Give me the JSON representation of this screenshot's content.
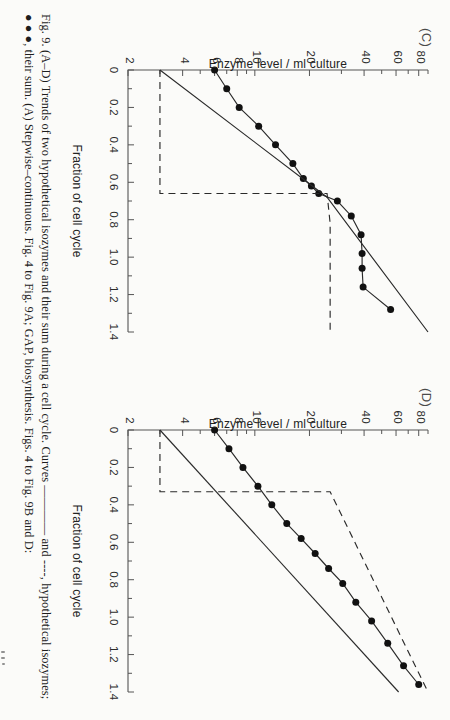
{
  "figure": {
    "caption_label": "Fig. 9.",
    "caption_line1": "Fig. 9. (A–D) Trends of two hypothetical isozymes and their sum during a cell cycle. Curves ———— and ----, hypothetical isozymes;",
    "caption_line2": "● ● ●, their sum. (A) Stepwise–continuous. Fig. 4 to Fig. 9A; GAP, biosynthesis. Figs. 4 to Fig. 9B and D:"
  },
  "chart_data": [
    {
      "type": "line",
      "panel": "(C)",
      "title": "(C)",
      "xlabel": "Fraction of cell cycle",
      "ylabel": "Enzyme level / ml culture",
      "xlim": [
        0,
        1.4
      ],
      "ylim": [
        2,
        90
      ],
      "yscale": "log",
      "xticks": [
        0,
        0.2,
        0.4,
        0.6,
        0.8,
        1.0,
        1.2,
        1.4
      ],
      "xticklabels": [
        "0",
        "0.2",
        "0.4",
        "0.6",
        "0.8",
        "1.0",
        "1.2",
        "1.4"
      ],
      "yticks": [
        2,
        4,
        6,
        8,
        10,
        20,
        40,
        60,
        80
      ],
      "yticklabels": [
        "2",
        "4",
        "6",
        "8",
        "10",
        "20",
        "40",
        "60",
        "80"
      ],
      "grid": false,
      "legend": false,
      "series": [
        {
          "name": "sum",
          "style": "markers-line",
          "marker": "filled-circle",
          "x": [
            0.0,
            0.1,
            0.2,
            0.3,
            0.4,
            0.5,
            0.58,
            0.62,
            0.66,
            0.7,
            0.78,
            0.88,
            0.98,
            1.06,
            1.16,
            1.28
          ],
          "y": [
            6.0,
            7.0,
            8.2,
            10.5,
            13.0,
            16.2,
            18.5,
            20.5,
            22.5,
            28.5,
            34.0,
            38.5,
            39.0,
            39.0,
            39.5,
            56.0
          ]
        },
        {
          "name": "isozyme-continuous",
          "style": "solid",
          "x": [
            0.0,
            0.68,
            1.4
          ],
          "y": [
            3.0,
            25.0,
            90.0
          ]
        },
        {
          "name": "isozyme-stepwise",
          "style": "dashed",
          "x": [
            0.0,
            0.66,
            0.66,
            0.82,
            1.4
          ],
          "y": [
            3.0,
            3.0,
            25.0,
            26.0,
            26.0
          ]
        }
      ]
    },
    {
      "type": "line",
      "panel": "(D)",
      "title": "(D)",
      "xlabel": "Fraction of cell cycle",
      "ylabel": "Enzyme level / ml culture",
      "xlim": [
        0,
        1.4
      ],
      "ylim": [
        2,
        90
      ],
      "yscale": "log",
      "xticks": [
        0,
        0.2,
        0.4,
        0.6,
        0.8,
        1.0,
        1.2,
        1.4
      ],
      "xticklabels": [
        "0",
        "0.2",
        "0.4",
        "0.6",
        "0.8",
        "1.0",
        "1.2",
        "1.4"
      ],
      "yticks": [
        2,
        4,
        6,
        8,
        10,
        20,
        40,
        60,
        80
      ],
      "yticklabels": [
        "2",
        "4",
        "6",
        "8",
        "10",
        "20",
        "40",
        "60",
        "80"
      ],
      "grid": false,
      "legend": false,
      "series": [
        {
          "name": "sum",
          "style": "markers-line",
          "marker": "filled-circle",
          "x": [
            0.0,
            0.1,
            0.2,
            0.3,
            0.4,
            0.5,
            0.58,
            0.66,
            0.74,
            0.82,
            0.92,
            1.02,
            1.14,
            1.26,
            1.36
          ],
          "y": [
            6.0,
            7.2,
            8.6,
            10.4,
            12.4,
            15.0,
            18.0,
            21.5,
            25.5,
            30.5,
            36.0,
            44.0,
            54.0,
            66.0,
            80.0
          ]
        },
        {
          "name": "isozyme-continuous",
          "style": "solid",
          "x": [
            0.0,
            1.4
          ],
          "y": [
            3.0,
            62.0
          ]
        },
        {
          "name": "isozyme-stepwise",
          "style": "dashed",
          "x": [
            0.0,
            0.33,
            0.33,
            1.4
          ],
          "y": [
            3.0,
            3.0,
            26.0,
            90.0
          ]
        }
      ]
    }
  ]
}
